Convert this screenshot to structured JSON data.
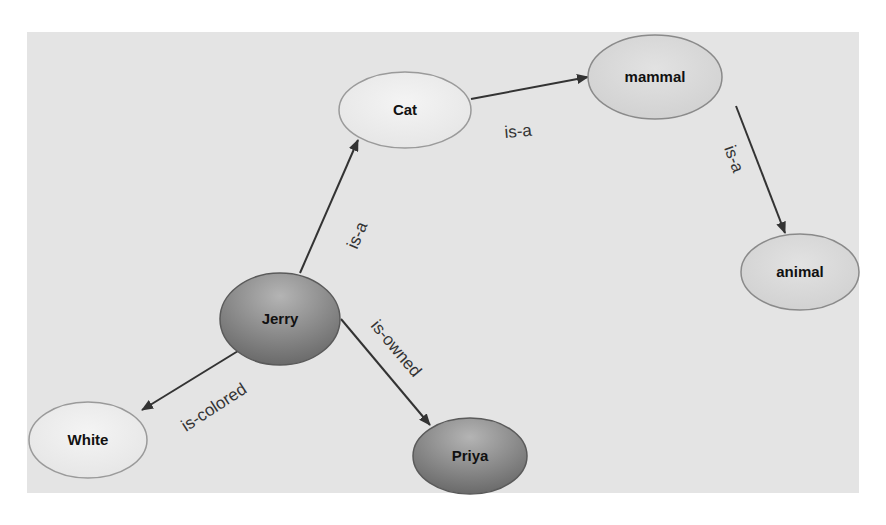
{
  "diagram": {
    "type": "semantic-network",
    "colors": {
      "panel": "#e4e4e4",
      "light_node": "#ececec",
      "light_node_stroke": "#9a9a9a",
      "dark_node_top": "#b0b0b0",
      "dark_node_bottom": "#6e6e6e",
      "dark_node_stroke": "#5a5a5a",
      "edge": "#333333"
    },
    "nodes": [
      {
        "id": "cat",
        "label": "Cat",
        "style": "light"
      },
      {
        "id": "mammal",
        "label": "mammal",
        "style": "medium"
      },
      {
        "id": "animal",
        "label": "animal",
        "style": "medium"
      },
      {
        "id": "jerry",
        "label": "Jerry",
        "style": "dark"
      },
      {
        "id": "white",
        "label": "White",
        "style": "light"
      },
      {
        "id": "priya",
        "label": "Priya",
        "style": "dark"
      }
    ],
    "edges": [
      {
        "from": "jerry",
        "to": "cat",
        "label": "is-a"
      },
      {
        "from": "cat",
        "to": "mammal",
        "label": "is-a"
      },
      {
        "from": "mammal",
        "to": "animal",
        "label": "is-a"
      },
      {
        "from": "jerry",
        "to": "white",
        "label": "is-colored"
      },
      {
        "from": "jerry",
        "to": "priya",
        "label": "is-owned"
      }
    ]
  }
}
